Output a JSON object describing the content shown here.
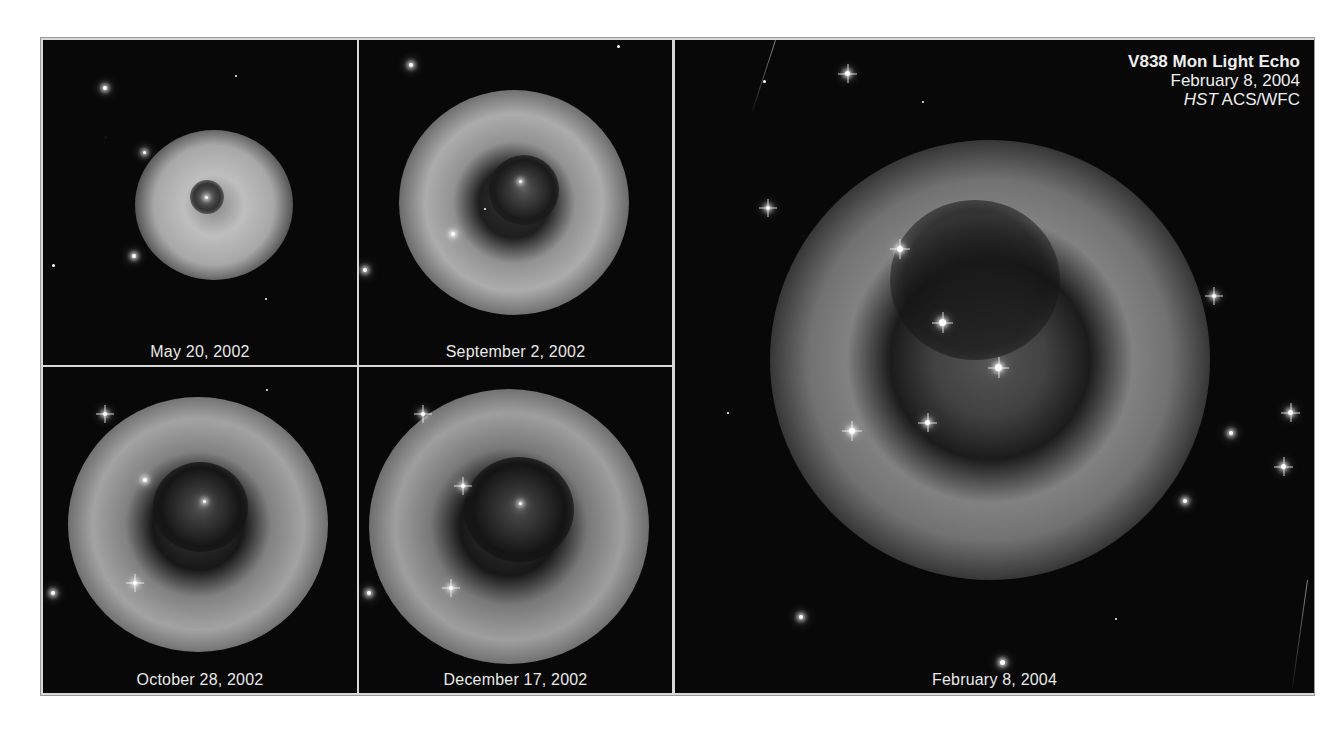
{
  "figure": {
    "title": "V838 Mon Light Echo",
    "date_line": "February 8, 2004",
    "instrument_prefix": "HST",
    "instrument_suffix": " ACS/WFC",
    "colors": {
      "background": "#070707",
      "frame": "#d8d8d8",
      "text": "#e8e8e8"
    }
  },
  "panels": [
    {
      "id": "may-2002",
      "caption": "May 20, 2002"
    },
    {
      "id": "sep-2002",
      "caption": "September 2, 2002"
    },
    {
      "id": "oct-2002",
      "caption": "October 28, 2002"
    },
    {
      "id": "dec-2002",
      "caption": "December 17, 2002"
    },
    {
      "id": "feb-2004",
      "caption": "February 8, 2004"
    }
  ]
}
